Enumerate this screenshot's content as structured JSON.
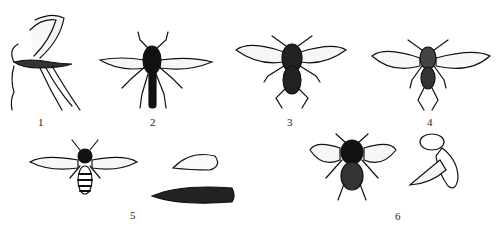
{
  "figure": {
    "labels": [
      "1",
      "2",
      "3",
      "4",
      "5",
      "6"
    ],
    "specimens": [
      {
        "label": "1",
        "view": "lateral",
        "body": "slender mosquito-like midge with long legs"
      },
      {
        "label": "2",
        "view": "dorsal",
        "body": "elongated dark robber-fly-like body"
      },
      {
        "label": "3",
        "view": "dorsal",
        "body": "stout dark fly"
      },
      {
        "label": "4",
        "view": "dorsal",
        "body": "small fly with broad clear wings"
      },
      {
        "label": "5",
        "view": "dorsal adult, pupa and larva",
        "body": "hoverfly-like banded abdomen"
      },
      {
        "label": "6",
        "view": "dorsal and lateral",
        "body": "housefly-like with patterned abdomen"
      }
    ],
    "colors": {
      "ink": "#111111",
      "background": "#ffffff"
    }
  }
}
